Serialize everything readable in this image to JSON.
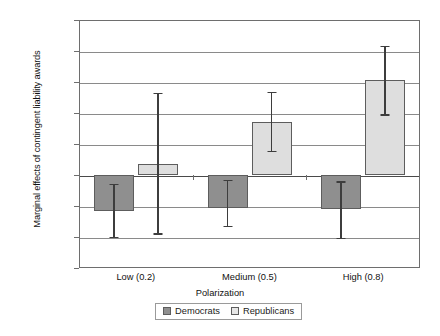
{
  "chart_data": {
    "type": "bar",
    "title": "",
    "xlabel": "Polarization",
    "ylabel": "Marginal effects of contingent liability awards",
    "categories": [
      "Low (0.2)",
      "Medium (0.5)",
      "High (0.8)"
    ],
    "ylim": [
      -0.015,
      0.025
    ],
    "yticks": [
      "0.025",
      "0.02",
      "0.015",
      "0.01",
      "0.005",
      "0",
      "-0.005",
      "-0.01",
      "-0.015"
    ],
    "ytick_values": [
      0.025,
      0.02,
      0.015,
      0.01,
      0.005,
      0,
      -0.005,
      -0.01,
      -0.015
    ],
    "grid": true,
    "legend_position": "bottom",
    "series": [
      {
        "name": "Democrats",
        "color": "#8f8f8f",
        "values": [
          -0.0058,
          -0.0053,
          -0.0055
        ],
        "error_low": [
          -0.01,
          -0.0082,
          -0.0101
        ],
        "error_high": [
          -0.0014,
          -0.0008,
          -0.001
        ]
      },
      {
        "name": "Republicans",
        "color": "#dedede",
        "values": [
          0.0018,
          0.0086,
          0.0153
        ],
        "error_low": [
          -0.0094,
          0.0039,
          0.0098
        ],
        "error_high": [
          0.0133,
          0.0134,
          0.0208
        ]
      }
    ]
  },
  "legend": {
    "items": [
      {
        "label": "Democrats",
        "swatch": "dem"
      },
      {
        "label": "Republicans",
        "swatch": "rep"
      }
    ]
  }
}
